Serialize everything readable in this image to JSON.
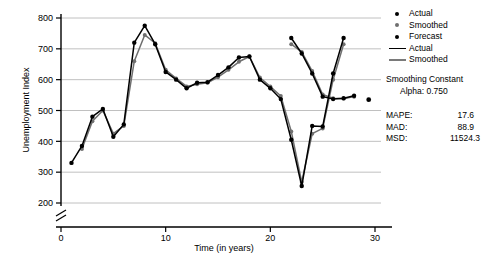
{
  "chart_data": {
    "type": "line",
    "title": "",
    "xlabel": "Time (in years)",
    "ylabel": "Unemployment Index",
    "xlim": [
      0,
      30
    ],
    "ylim": [
      200,
      800
    ],
    "xticks": [
      0,
      10,
      20,
      30
    ],
    "yticks": [
      200,
      300,
      400,
      500,
      600,
      700,
      800
    ],
    "grid": "horizontal",
    "y_axis_break": true,
    "legend_position": "right",
    "x": [
      1,
      2,
      3,
      4,
      5,
      6,
      7,
      8,
      9,
      10,
      11,
      12,
      13,
      14,
      15,
      16,
      17,
      18,
      19,
      20,
      21,
      22,
      23,
      24,
      25,
      26,
      27
    ],
    "series": [
      {
        "name": "Actual",
        "color": "#000000",
        "marker": "circle",
        "values": [
          330,
          385,
          480,
          505,
          415,
          455,
          720,
          775,
          715,
          625,
          600,
          572,
          590,
          592,
          615,
          640,
          672,
          675,
          600,
          572,
          537,
          405,
          255,
          450,
          448,
          620,
          735
        ]
      },
      {
        "name": "Smoothed",
        "color": "#6f6f6f",
        "marker": "circle",
        "values": [
          null,
          375,
          465,
          500,
          425,
          450,
          660,
          745,
          718,
          632,
          604,
          578,
          585,
          590,
          608,
          632,
          658,
          675,
          607,
          578,
          547,
          432,
          268,
          425,
          442,
          600,
          715
        ]
      }
    ],
    "actual_tail": {
      "x": [
        22,
        23,
        24,
        25,
        26,
        27,
        28
      ],
      "values": [
        735,
        685,
        620,
        545,
        537,
        540,
        548
      ]
    },
    "forecast": {
      "name": "Forecast",
      "color": "#000000",
      "x": [
        28
      ],
      "values": [
        535
      ]
    },
    "legend_items": [
      {
        "label": "Actual",
        "marker": "dot",
        "color": "#000000"
      },
      {
        "label": "Smoothed",
        "marker": "dot",
        "color": "#6f6f6f"
      },
      {
        "label": "Forecast",
        "marker": "dot",
        "color": "#000000"
      },
      {
        "label": "Actual",
        "marker": "line",
        "color": "#000000"
      },
      {
        "label": "Smoothed",
        "marker": "line",
        "color": "#7a7a7a"
      }
    ],
    "smoothing": {
      "heading": "Smoothing Constant",
      "alpha_label": "Alpha: 0.750"
    },
    "accuracy": [
      {
        "key": "MAPE:",
        "value": "17.6"
      },
      {
        "key": "MAD:",
        "value": "88.9"
      },
      {
        "key": "MSD:",
        "value": "11524.3"
      }
    ]
  },
  "axis": {
    "x_tick_labels": [
      "0",
      "10",
      "20",
      "30"
    ],
    "y_tick_labels": [
      "200",
      "300",
      "400",
      "500",
      "600",
      "700",
      "800"
    ],
    "x_title": "Time (in years)",
    "y_title": "Unemployment Index"
  }
}
